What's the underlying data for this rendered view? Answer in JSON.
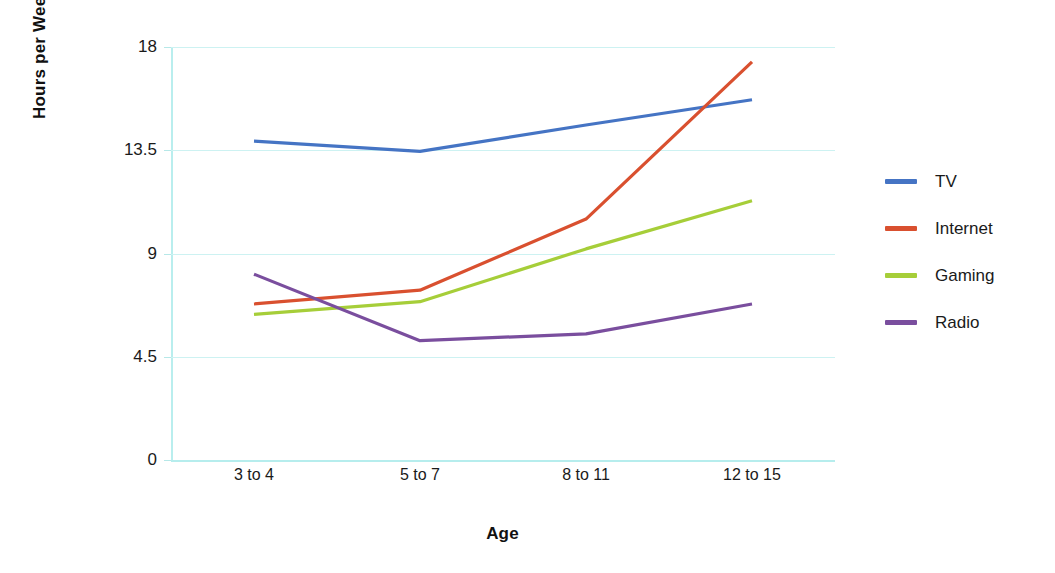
{
  "chart_data": {
    "type": "line",
    "title": "",
    "xlabel": "Age",
    "ylabel": "Hours per Week",
    "categories": [
      "3 to 4",
      "5 to 7",
      "8 to 11",
      "12 to 15"
    ],
    "ylim": [
      0,
      18
    ],
    "yticks": [
      0,
      4.5,
      9,
      13.5,
      18
    ],
    "ytick_labels": [
      "0",
      "4.5",
      "9",
      "13.5",
      "18"
    ],
    "grid": true,
    "legend_position": "right",
    "series": [
      {
        "name": "TV",
        "color": "#4574c4",
        "values": [
          13.9,
          13.45,
          14.6,
          15.7
        ]
      },
      {
        "name": "Internet",
        "color": "#d9502f",
        "values": [
          6.8,
          7.4,
          10.5,
          17.35
        ]
      },
      {
        "name": "Gaming",
        "color": "#a6ce39",
        "values": [
          6.35,
          6.9,
          9.2,
          11.3
        ]
      },
      {
        "name": "Radio",
        "color": "#7a4e9e",
        "values": [
          8.1,
          5.2,
          5.5,
          6.8
        ]
      }
    ]
  },
  "axes": {
    "y_title": "Hours per Week",
    "x_title": "Age"
  },
  "legend": {
    "items": [
      {
        "label": "TV",
        "color": "#4574c4"
      },
      {
        "label": "Internet",
        "color": "#d9502f"
      },
      {
        "label": "Gaming",
        "color": "#a6ce39"
      },
      {
        "label": "Radio",
        "color": "#7a4e9e"
      }
    ]
  }
}
